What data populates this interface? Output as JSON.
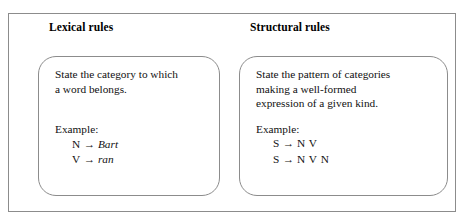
{
  "figure": {
    "background_color": "#ffffff",
    "border_color": "#8c8c8c",
    "text_color": "#111111",
    "arrow_glyph": "→"
  },
  "panels": [
    {
      "id": "lexical",
      "heading": "Lexical rules",
      "description": [
        "State the category to which",
        "a word belongs."
      ],
      "example_label": "Example:",
      "rules": [
        {
          "lhs": "N",
          "arrow": "→",
          "rhs": "Bart",
          "rhs_italic": true
        },
        {
          "lhs": "V",
          "arrow": "→",
          "rhs": "ran",
          "rhs_italic": true
        }
      ]
    },
    {
      "id": "structural",
      "heading": "Structural rules",
      "description": [
        "State the pattern of categories",
        "making a well-formed",
        "expression of a given kind."
      ],
      "example_label": "Example:",
      "rules": [
        {
          "lhs": "S",
          "arrow": "→",
          "rhs": "N V",
          "rhs_italic": false
        },
        {
          "lhs": "S",
          "arrow": "→",
          "rhs": "N V N",
          "rhs_italic": false
        }
      ]
    }
  ]
}
